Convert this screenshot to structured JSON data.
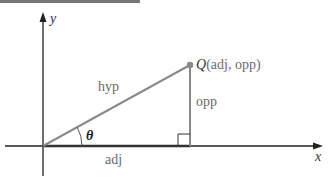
{
  "diagram": {
    "axes": {
      "x_label": "x",
      "y_label": "y"
    },
    "point": {
      "name": "Q",
      "coords": "(adj, opp)"
    },
    "sides": {
      "hypotenuse": "hyp",
      "opposite": "opp",
      "adjacent": "adj"
    },
    "angle": "θ",
    "colors": {
      "triangle": "#8a8a8a",
      "axes": "#222222",
      "point": "#8a8a8a"
    }
  }
}
